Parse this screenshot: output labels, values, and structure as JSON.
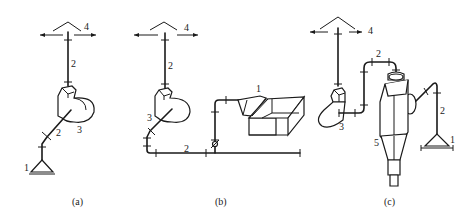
{
  "figure": {
    "panels": [
      {
        "id": "a",
        "caption": "(a)",
        "labels": {
          "hood": "1",
          "pipe_upper": "2",
          "pipe_lower": "2",
          "fan": "3",
          "outlet": "4"
        }
      },
      {
        "id": "b",
        "caption": "(b)",
        "labels": {
          "hood": "1",
          "pipe_upper": "2",
          "pipe_lower": "2",
          "fan": "3",
          "outlet": "4"
        }
      },
      {
        "id": "c",
        "caption": "(c)",
        "labels": {
          "hood": "1",
          "pipe_upper": "2",
          "pipe_right": "2",
          "fan": "3",
          "outlet": "4",
          "cyclone": "5"
        }
      }
    ],
    "colors": {
      "line": "#1a1a1a",
      "background": "#ffffff"
    }
  }
}
